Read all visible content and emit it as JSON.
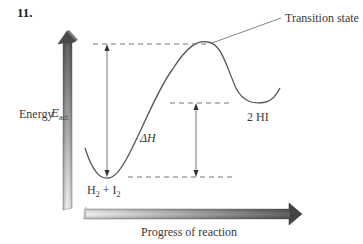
{
  "problem_number": "11.",
  "labels": {
    "transition_state": "Transition state",
    "products": "2 HI",
    "reactants_h": "H",
    "reactants_sub1": "2",
    "reactants_plus": " + I",
    "reactants_sub2": "2",
    "energy_axis": "Energy",
    "progress_axis": "Progress of reaction",
    "activation_energy_symbol": "E",
    "activation_energy_sub": "act",
    "enthalpy_change": "ΔH"
  },
  "colors": {
    "curve": "#555555",
    "dashed": "#666666",
    "axis_dark": "#555555",
    "axis_light": "#e6e6e6"
  }
}
